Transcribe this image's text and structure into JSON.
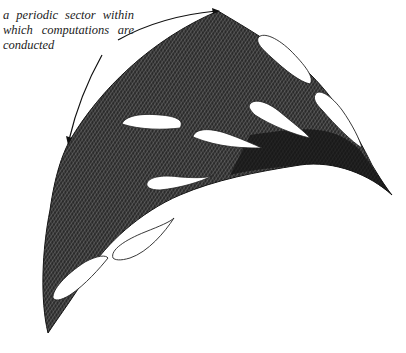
{
  "figure": {
    "annotation": {
      "line1": "a periodic sector within",
      "line2": "which computations are",
      "line3": "conducted"
    },
    "colors": {
      "mesh": "#1a1a1a",
      "blade_fill": "#ffffff",
      "background": "#ffffff",
      "arrow": "#111111"
    }
  }
}
